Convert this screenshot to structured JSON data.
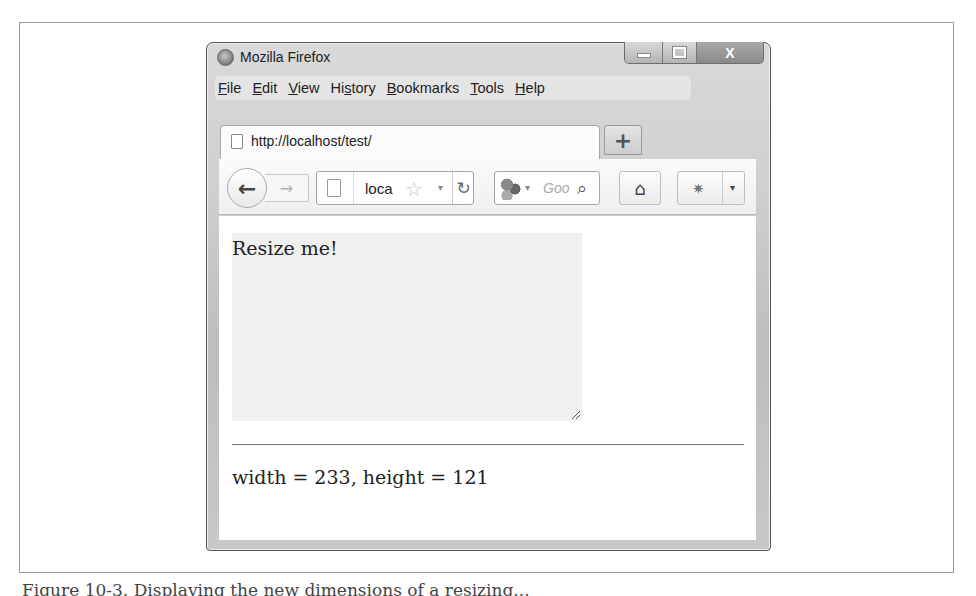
{
  "window": {
    "title": "Mozilla Firefox",
    "controls": {
      "minimize": "minimize",
      "maximize": "maximize",
      "close": "X"
    }
  },
  "menubar": {
    "items": [
      {
        "label": "File",
        "accel": "F",
        "rest": "ile"
      },
      {
        "label": "Edit",
        "accel": "E",
        "rest": "dit"
      },
      {
        "label": "View",
        "accel": "V",
        "rest": "iew"
      },
      {
        "label": "History",
        "pre": "Hi",
        "accel": "s",
        "rest": "tory"
      },
      {
        "label": "Bookmarks",
        "accel": "B",
        "rest": "ookmarks"
      },
      {
        "label": "Tools",
        "accel": "T",
        "rest": "ools"
      },
      {
        "label": "Help",
        "accel": "H",
        "rest": "elp"
      }
    ]
  },
  "tabs": {
    "active": {
      "title": "http://localhost/test/"
    },
    "new_tab_label": "+"
  },
  "navbar": {
    "back_glyph": "←",
    "forward_glyph": "→",
    "url_value": "loca",
    "bookmark_star": "☆",
    "dropdown_glyph": "▾",
    "reload_glyph": "↻",
    "search_placeholder": "Goo",
    "search_glyph": "⌕",
    "home_glyph": "⌂",
    "addon_glyph": "✷"
  },
  "page": {
    "resizable_text": "Resize me!",
    "dimensions_text": "width = 233, height = 121"
  },
  "figure": {
    "caption": "Figure 10-3. Displaying the new dimensions of a resizing..."
  }
}
